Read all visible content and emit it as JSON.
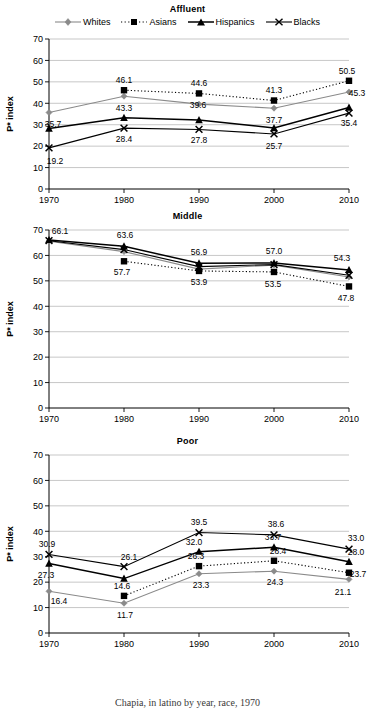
{
  "figure": {
    "caption": "Chapia, in latino by year, race, 1970"
  },
  "legend": {
    "position": "top",
    "entries": [
      {
        "label": "Whites",
        "marker": "diamond-marker",
        "line": "solid-gray-line"
      },
      {
        "label": "Asians",
        "marker": "square-marker",
        "line": "dotted-black-line"
      },
      {
        "label": "Hispanics",
        "marker": "triangle-marker",
        "line": "solid-black-thick-line"
      },
      {
        "label": "Blacks",
        "marker": "x-marker",
        "line": "solid-black-line"
      }
    ]
  },
  "axes": {
    "ylabel": "P* index",
    "yticks": [
      "0",
      "10",
      "20",
      "30",
      "40",
      "50",
      "60",
      "70"
    ],
    "xticks": [
      "1970",
      "1980",
      "1990",
      "2000",
      "2010"
    ],
    "ylim": [
      0,
      70
    ],
    "grid": true
  },
  "chart_data": [
    {
      "type": "line",
      "title": "Affluent",
      "xlabel": "",
      "ylabel": "P* index",
      "ylim": [
        0,
        70
      ],
      "grid": true,
      "legend_position": "top",
      "categories": [
        "1970",
        "1980",
        "1990",
        "2000",
        "2010"
      ],
      "series": [
        {
          "name": "Whites",
          "values": [
            35.7,
            43.3,
            39.6,
            37.7,
            45.3
          ],
          "labels": [
            "35.7",
            "43.3",
            "39.6",
            "37.7",
            "45.3"
          ]
        },
        {
          "name": "Asians",
          "values": [
            null,
            46.1,
            44.6,
            41.3,
            50.5
          ],
          "labels": [
            "",
            "46.1",
            "44.6",
            "41.3",
            "50.5"
          ]
        },
        {
          "name": "Hispanics",
          "values": [
            28.2,
            33.2,
            32.2,
            28.5,
            38.0
          ],
          "labels": [
            "",
            "",
            "",
            "",
            ""
          ]
        },
        {
          "name": "Blacks",
          "values": [
            19.2,
            28.4,
            27.8,
            25.7,
            35.4
          ],
          "labels": [
            "19.2",
            "28.4",
            "27.8",
            "25.7",
            "35.4"
          ]
        }
      ]
    },
    {
      "type": "line",
      "title": "Middle",
      "xlabel": "",
      "ylabel": "P* index",
      "ylim": [
        0,
        70
      ],
      "grid": true,
      "legend_position": "none",
      "categories": [
        "1970",
        "1980",
        "1990",
        "2000",
        "2010"
      ],
      "series": [
        {
          "name": "Whites",
          "values": [
            65.6,
            61.5,
            54.6,
            56.2,
            51.5
          ],
          "labels": [
            "",
            "",
            "",
            "",
            ""
          ]
        },
        {
          "name": "Asians",
          "values": [
            null,
            57.7,
            53.9,
            53.5,
            47.8
          ],
          "labels": [
            "",
            "57.7",
            "53.9",
            "53.5",
            "47.8"
          ]
        },
        {
          "name": "Hispanics",
          "values": [
            66.1,
            63.6,
            56.9,
            57.0,
            54.3
          ],
          "labels": [
            "66.1",
            "63.6",
            "56.9",
            "57.0",
            "54.3"
          ]
        },
        {
          "name": "Blacks",
          "values": [
            65.8,
            62.3,
            55.6,
            56.4,
            52.2
          ],
          "labels": [
            "",
            "",
            "",
            "",
            ""
          ]
        }
      ]
    },
    {
      "type": "line",
      "title": "Poor",
      "xlabel": "",
      "ylabel": "P* index",
      "ylim": [
        0,
        70
      ],
      "grid": true,
      "legend_position": "none",
      "categories": [
        "1970",
        "1980",
        "1990",
        "2000",
        "2010"
      ],
      "series": [
        {
          "name": "Whites",
          "values": [
            16.4,
            11.7,
            23.3,
            24.3,
            21.1
          ],
          "labels": [
            "16.4",
            "11.7",
            "23.3",
            "24.3",
            "21.1"
          ]
        },
        {
          "name": "Asians",
          "values": [
            null,
            14.6,
            26.3,
            28.4,
            23.7
          ],
          "labels": [
            "",
            "14.6",
            "26.3",
            "28.4",
            "23.7"
          ]
        },
        {
          "name": "Hispanics",
          "values": [
            27.3,
            21.4,
            32.0,
            33.7,
            28.0
          ],
          "labels": [
            "27.3",
            "",
            "32.0",
            "33.7",
            "28.0"
          ]
        },
        {
          "name": "Blacks",
          "values": [
            30.9,
            26.1,
            39.5,
            38.6,
            33.0
          ],
          "labels": [
            "30.9",
            "26.1",
            "39.5",
            "38.6",
            "33.0"
          ]
        }
      ]
    }
  ],
  "label_offsets": {
    "affluent": {
      "Whites": [
        {
          "dx": 4,
          "dy": 14
        },
        {
          "dx": 0,
          "dy": 15
        },
        {
          "dx": -1,
          "dy": 4
        },
        {
          "dx": 0,
          "dy": 15
        },
        {
          "dx": 8,
          "dy": 4
        }
      ],
      "Asians": [
        null,
        {
          "dx": 0,
          "dy": -7
        },
        {
          "dx": 0,
          "dy": -7
        },
        {
          "dx": 0,
          "dy": -8
        },
        {
          "dx": -2,
          "dy": -7
        }
      ],
      "Hispanics": [
        null,
        null,
        null,
        null,
        null
      ],
      "Blacks": [
        {
          "dx": 6,
          "dy": 16
        },
        {
          "dx": 0,
          "dy": 14
        },
        {
          "dx": 0,
          "dy": 14
        },
        {
          "dx": 0,
          "dy": 15
        },
        {
          "dx": 0,
          "dy": 13
        }
      ]
    },
    "middle": {
      "Whites": [
        null,
        null,
        null,
        null,
        null
      ],
      "Asians": [
        null,
        {
          "dx": -2,
          "dy": 14
        },
        {
          "dx": 0,
          "dy": 14
        },
        {
          "dx": -1,
          "dy": 15
        },
        {
          "dx": -3,
          "dy": 15
        }
      ],
      "Hispanics": [
        {
          "dx": 11,
          "dy": -6
        },
        {
          "dx": 1,
          "dy": -8
        },
        {
          "dx": 0,
          "dy": -8
        },
        {
          "dx": 0,
          "dy": -9
        },
        {
          "dx": -7,
          "dy": -9
        }
      ],
      "Blacks": [
        null,
        null,
        null,
        null,
        null
      ]
    },
    "poor": {
      "Whites": [
        {
          "dx": 10,
          "dy": 13
        },
        {
          "dx": 1,
          "dy": 15
        },
        {
          "dx": 2,
          "dy": 14
        },
        {
          "dx": 1,
          "dy": 14
        },
        {
          "dx": -6,
          "dy": 16
        }
      ],
      "Asians": [
        null,
        {
          "dx": -2,
          "dy": -7
        },
        {
          "dx": -3,
          "dy": -7
        },
        {
          "dx": 4,
          "dy": -7
        },
        {
          "dx": 9,
          "dy": 4
        }
      ],
      "Hispanics": [
        {
          "dx": -3,
          "dy": 14
        },
        null,
        {
          "dx": -5,
          "dy": -7
        },
        {
          "dx": -1,
          "dy": -7
        },
        {
          "dx": 7,
          "dy": -7
        }
      ],
      "Blacks": [
        {
          "dx": -2,
          "dy": -7
        },
        {
          "dx": 5,
          "dy": -7
        },
        {
          "dx": 0,
          "dy": -8
        },
        {
          "dx": 2,
          "dy": -8
        },
        {
          "dx": 7,
          "dy": -8
        }
      ]
    }
  }
}
